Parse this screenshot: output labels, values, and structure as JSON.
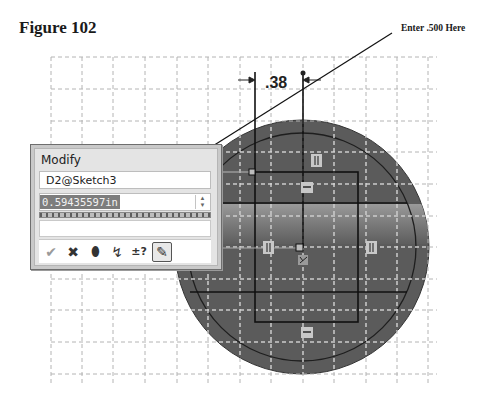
{
  "figure": {
    "title": "Figure 102",
    "callout": "Enter .500 Here"
  },
  "sketch": {
    "dimension_label": ".38",
    "grid": {
      "x_start": 51,
      "x_step": 31.4,
      "columns": 12,
      "y_start": 57,
      "y_step": 31.7,
      "rows": 10
    },
    "colors": {
      "body": "#5a5a5a",
      "inner": "#626262",
      "band": "#8a8a8a",
      "lines": "#111111",
      "grid": "#b0b0b0"
    }
  },
  "modify_dialog": {
    "title": "Modify",
    "dimension_name": "D2@Sketch3",
    "value": "0.59435597in",
    "buttons": [
      {
        "name": "ok-button",
        "icon": "✔"
      },
      {
        "name": "cancel-button",
        "icon": "✖"
      },
      {
        "name": "rebuild-button",
        "icon": "⬮"
      },
      {
        "name": "reverse-dimension-button",
        "icon": "↯"
      },
      {
        "name": "mark-dimension-button",
        "icon": "±?"
      },
      {
        "name": "drive-dimension-button",
        "icon": "✎"
      }
    ]
  }
}
